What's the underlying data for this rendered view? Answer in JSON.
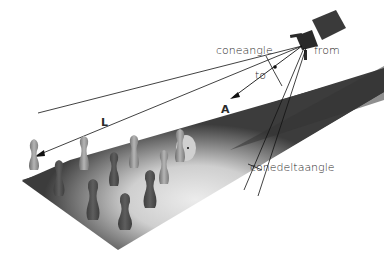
{
  "figure": {
    "labels": {
      "coneangle": "coneangle",
      "from": "from",
      "to": "to",
      "axis": "A",
      "light_direction": "L",
      "conedeltaangle": "conedeltaangle"
    },
    "colors": {
      "background": "#ffffff",
      "lane_dark": "#3a3a3a",
      "lane_lit": "#e8e8e8",
      "pin": "#9a9a9a",
      "line": "#111111",
      "text": "#2a2a2a"
    }
  }
}
